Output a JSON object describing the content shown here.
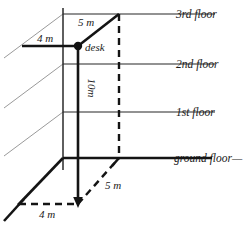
{
  "diagram": {
    "colors": {
      "ink": "#1a1a1a",
      "thin_line": "#6e6e6e",
      "guide_line": "#9a9a9a",
      "background": "#ffffff"
    },
    "floor_labels": [
      {
        "id": "third-floor",
        "text": "3rd floor",
        "y": 14
      },
      {
        "id": "second-floor",
        "text": "2nd floor",
        "y": 64
      },
      {
        "id": "first-floor",
        "text": "1st floor",
        "y": 112
      },
      {
        "id": "ground-floor",
        "text": "ground floor",
        "y": 158
      }
    ],
    "ground_floor_trailing_dash": "—",
    "dimensions": {
      "top_width": "5 m",
      "desk_depth": "4 m",
      "height": "10m",
      "base_width": "5 m",
      "base_depth": "4 m"
    },
    "desk": {
      "label": "desk",
      "x": 78,
      "y": 46
    }
  }
}
